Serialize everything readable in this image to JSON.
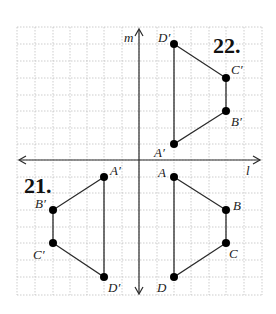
{
  "axes": {
    "vertical_label": "m",
    "horizontal_label": "l"
  },
  "problems": [
    {
      "number": "22.",
      "vertices": [
        {
          "name": "D′",
          "x": 174,
          "y": 44
        },
        {
          "name": "C′",
          "x": 226,
          "y": 78
        },
        {
          "name": "B′",
          "x": 226,
          "y": 111
        },
        {
          "name": "A′",
          "x": 174,
          "y": 144
        }
      ]
    },
    {
      "number": "21.",
      "original": [
        {
          "name": "A",
          "x": 174,
          "y": 177
        },
        {
          "name": "B",
          "x": 226,
          "y": 210
        },
        {
          "name": "C",
          "x": 226,
          "y": 243
        },
        {
          "name": "D",
          "x": 174,
          "y": 277
        }
      ],
      "image": [
        {
          "name": "A′",
          "x": 104,
          "y": 177
        },
        {
          "name": "B′",
          "x": 53,
          "y": 210
        },
        {
          "name": "C′",
          "x": 53,
          "y": 243
        },
        {
          "name": "D′",
          "x": 104,
          "y": 277
        }
      ]
    }
  ],
  "labels": {
    "m": "m",
    "l": "l",
    "num22": "22.",
    "num21": "21.",
    "D_prime_top": "D′",
    "C_prime_top": "C′",
    "B_prime_top": "B′",
    "A_prime_top": "A′",
    "A": "A",
    "B": "B",
    "C": "C",
    "D": "D",
    "A_prime_left": "A′",
    "B_prime_left": "B′",
    "C_prime_left": "C′",
    "D_prime_left": "D′"
  }
}
